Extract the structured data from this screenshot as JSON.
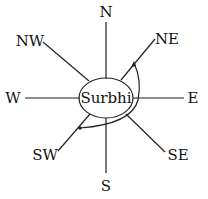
{
  "diagram": {
    "type": "compass-direction",
    "center_label": "Surbhi",
    "directions": {
      "n": "N",
      "ne": "NE",
      "e": "E",
      "se": "SE",
      "s": "S",
      "sw": "SW",
      "w": "W",
      "nw": "NW"
    },
    "arc": {
      "from": "NE",
      "to": "SW",
      "rotation": "clockwise"
    },
    "colors": {
      "line": "#222222",
      "text": "#111111",
      "background": "#ffffff"
    }
  }
}
